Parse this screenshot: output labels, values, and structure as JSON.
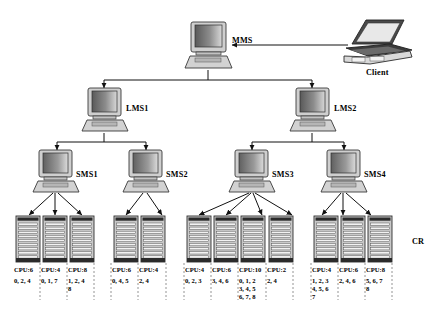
{
  "diagram": {
    "nodes": {
      "mms": {
        "label": "MMS",
        "type": "desktop-computer",
        "x": 208,
        "y": 24
      },
      "client": {
        "label": "Client",
        "type": "laptop-computer",
        "x": 372,
        "y": 22
      },
      "lms1": {
        "label": "LMS1",
        "type": "desktop-computer",
        "x": 104,
        "y": 90
      },
      "lms2": {
        "label": "LMS2",
        "type": "desktop-computer",
        "x": 296,
        "y": 90
      },
      "sms1": {
        "label": "SMS1",
        "type": "desktop-computer",
        "x": 53,
        "y": 152
      },
      "sms2": {
        "label": "SMS2",
        "type": "desktop-computer",
        "x": 142,
        "y": 152
      },
      "sms3": {
        "label": "SMS3",
        "type": "desktop-computer",
        "x": 248,
        "y": 152
      },
      "sms4": {
        "label": "SMS4",
        "type": "desktop-computer",
        "x": 340,
        "y": 152
      }
    },
    "cr_label": "CR",
    "racks": [
      {
        "parent": "sms1",
        "cpu": "CPU:6",
        "jobs": [
          "0, 2, 4"
        ]
      },
      {
        "parent": "sms1",
        "cpu": "CPU:4",
        "jobs": [
          "0, 1, 7"
        ]
      },
      {
        "parent": "sms1",
        "cpu": "CPU:8",
        "jobs": [
          "1, 2, 4",
          "8"
        ]
      },
      {
        "parent": "sms2",
        "cpu": "CPU:6",
        "jobs": [
          "0, 4, 5"
        ]
      },
      {
        "parent": "sms2",
        "cpu": "CPU:4",
        "jobs": [
          "2, 4"
        ]
      },
      {
        "parent": "sms3",
        "cpu": "CPU:4",
        "jobs": [
          "0, 2, 3"
        ]
      },
      {
        "parent": "sms3",
        "cpu": "CPU:6",
        "jobs": [
          "3, 4, 6"
        ]
      },
      {
        "parent": "sms3",
        "cpu": "CPU:10",
        "jobs": [
          "0, 1, 2",
          "3, 4, 5",
          "6, 7, 8"
        ]
      },
      {
        "parent": "sms3",
        "cpu": "CPU:2",
        "jobs": [
          "2, 4"
        ]
      },
      {
        "parent": "sms4",
        "cpu": "CPU:4",
        "jobs": [
          "1, 2, 3",
          "4, 5, 6",
          "7"
        ]
      },
      {
        "parent": "sms4",
        "cpu": "CPU:6",
        "jobs": [
          "2, 4, 6"
        ]
      },
      {
        "parent": "sms4",
        "cpu": "CPU:8",
        "jobs": [
          "5, 6, 7",
          "8"
        ]
      }
    ],
    "colors": {
      "line": "#1a1a1a",
      "screen_dark": "#6e6e6e",
      "screen_light": "#d5d5d5",
      "case": "#cfcfcf",
      "rack_body": "#c9c9c9",
      "rack_slot": "#f2f2f2",
      "rack_dark": "#2b2b2b"
    }
  }
}
